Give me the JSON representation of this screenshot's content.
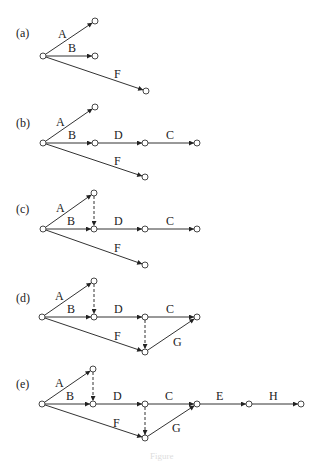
{
  "caption": "Figure",
  "colors": {
    "line": "#333333",
    "node_fill": "#ffffff",
    "text": "#222222"
  },
  "panels": [
    {
      "id": "a",
      "label": "(a)",
      "label_pos": [
        16,
        37
      ],
      "nodes": [
        [
          43,
          56
        ],
        [
          95,
          21
        ],
        [
          95,
          56
        ],
        [
          146,
          91
        ]
      ],
      "edges": [
        {
          "from": 0,
          "to": 1,
          "label": "A",
          "lx": 58,
          "ly": 38,
          "dashed": false
        },
        {
          "from": 0,
          "to": 2,
          "label": "B",
          "lx": 68,
          "ly": 52,
          "dashed": false
        },
        {
          "from": 0,
          "to": 3,
          "label": "F",
          "lx": 114,
          "ly": 78,
          "dashed": false
        }
      ]
    },
    {
      "id": "b",
      "label": "(b)",
      "label_pos": [
        16,
        127
      ],
      "nodes": [
        [
          43,
          143
        ],
        [
          95,
          107
        ],
        [
          95,
          143
        ],
        [
          145,
          143
        ],
        [
          197,
          143
        ],
        [
          145,
          177
        ]
      ],
      "edges": [
        {
          "from": 0,
          "to": 1,
          "label": "A",
          "lx": 56,
          "ly": 126,
          "dashed": false
        },
        {
          "from": 0,
          "to": 2,
          "label": "B",
          "lx": 68,
          "ly": 139,
          "dashed": false
        },
        {
          "from": 2,
          "to": 3,
          "label": "D",
          "lx": 114,
          "ly": 139,
          "dashed": false
        },
        {
          "from": 3,
          "to": 4,
          "label": "C",
          "lx": 166,
          "ly": 139,
          "dashed": false
        },
        {
          "from": 0,
          "to": 5,
          "label": "F",
          "lx": 114,
          "ly": 165,
          "dashed": false
        }
      ]
    },
    {
      "id": "c",
      "label": "(c)",
      "label_pos": [
        16,
        213
      ],
      "nodes": [
        [
          43,
          229
        ],
        [
          94,
          193
        ],
        [
          94,
          229
        ],
        [
          145,
          229
        ],
        [
          197,
          229
        ],
        [
          145,
          265
        ]
      ],
      "edges": [
        {
          "from": 0,
          "to": 1,
          "label": "A",
          "lx": 56,
          "ly": 212,
          "dashed": false
        },
        {
          "from": 0,
          "to": 2,
          "label": "B",
          "lx": 67,
          "ly": 225,
          "dashed": false
        },
        {
          "from": 1,
          "to": 2,
          "label": "",
          "lx": 0,
          "ly": 0,
          "dashed": true
        },
        {
          "from": 2,
          "to": 3,
          "label": "D",
          "lx": 114,
          "ly": 225,
          "dashed": false
        },
        {
          "from": 3,
          "to": 4,
          "label": "C",
          "lx": 166,
          "ly": 225,
          "dashed": false
        },
        {
          "from": 0,
          "to": 5,
          "label": "F",
          "lx": 114,
          "ly": 252,
          "dashed": false
        }
      ]
    },
    {
      "id": "d",
      "label": "(d)",
      "label_pos": [
        16,
        302
      ],
      "nodes": [
        [
          42,
          317
        ],
        [
          94,
          281
        ],
        [
          94,
          317
        ],
        [
          145,
          317
        ],
        [
          197,
          317
        ],
        [
          145,
          352
        ]
      ],
      "edges": [
        {
          "from": 0,
          "to": 1,
          "label": "A",
          "lx": 55,
          "ly": 300,
          "dashed": false
        },
        {
          "from": 0,
          "to": 2,
          "label": "B",
          "lx": 67,
          "ly": 313,
          "dashed": false
        },
        {
          "from": 1,
          "to": 2,
          "label": "",
          "lx": 0,
          "ly": 0,
          "dashed": true
        },
        {
          "from": 2,
          "to": 3,
          "label": "D",
          "lx": 114,
          "ly": 313,
          "dashed": false
        },
        {
          "from": 3,
          "to": 4,
          "label": "C",
          "lx": 166,
          "ly": 313,
          "dashed": false
        },
        {
          "from": 0,
          "to": 5,
          "label": "F",
          "lx": 114,
          "ly": 340,
          "dashed": false
        },
        {
          "from": 3,
          "to": 5,
          "label": "",
          "lx": 0,
          "ly": 0,
          "dashed": true
        },
        {
          "from": 5,
          "to": 4,
          "label": "G",
          "lx": 173,
          "ly": 346,
          "dashed": false
        }
      ]
    },
    {
      "id": "e",
      "label": "(e)",
      "label_pos": [
        16,
        388
      ],
      "nodes": [
        [
          42,
          404
        ],
        [
          93,
          369
        ],
        [
          93,
          404
        ],
        [
          145,
          404
        ],
        [
          197,
          404
        ],
        [
          145,
          438
        ],
        [
          249,
          404
        ],
        [
          301,
          404
        ]
      ],
      "edges": [
        {
          "from": 0,
          "to": 1,
          "label": "A",
          "lx": 55,
          "ly": 387,
          "dashed": false
        },
        {
          "from": 0,
          "to": 2,
          "label": "B",
          "lx": 66,
          "ly": 400,
          "dashed": false
        },
        {
          "from": 1,
          "to": 2,
          "label": "",
          "lx": 0,
          "ly": 0,
          "dashed": true
        },
        {
          "from": 2,
          "to": 3,
          "label": "D",
          "lx": 113,
          "ly": 400,
          "dashed": false
        },
        {
          "from": 3,
          "to": 4,
          "label": "C",
          "lx": 165,
          "ly": 400,
          "dashed": false
        },
        {
          "from": 0,
          "to": 5,
          "label": "F",
          "lx": 113,
          "ly": 427,
          "dashed": false
        },
        {
          "from": 3,
          "to": 5,
          "label": "",
          "lx": 0,
          "ly": 0,
          "dashed": true
        },
        {
          "from": 5,
          "to": 4,
          "label": "G",
          "lx": 172,
          "ly": 432,
          "dashed": false
        },
        {
          "from": 4,
          "to": 6,
          "label": "E",
          "lx": 216,
          "ly": 400,
          "dashed": false
        },
        {
          "from": 6,
          "to": 7,
          "label": "H",
          "lx": 269,
          "ly": 400,
          "dashed": false
        }
      ]
    }
  ]
}
